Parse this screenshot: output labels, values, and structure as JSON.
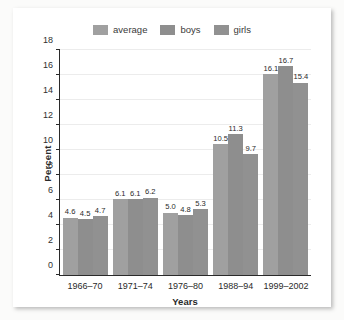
{
  "chart_data": {
    "type": "bar",
    "title": "",
    "xlabel": "Years",
    "ylabel": "Percent",
    "categories": [
      "1966–70",
      "1971–74",
      "1976–80",
      "1988–94",
      "1999–2002"
    ],
    "series": [
      {
        "name": "average",
        "color": "#a0a0a0",
        "values": [
          4.6,
          6.1,
          5.0,
          10.5,
          16.1
        ]
      },
      {
        "name": "boys",
        "color": "#8e8e8e",
        "values": [
          4.5,
          6.1,
          4.8,
          11.3,
          16.7
        ]
      },
      {
        "name": "girls",
        "color": "#919191",
        "values": [
          4.7,
          6.2,
          5.3,
          9.7,
          15.4
        ]
      }
    ],
    "value_labels": [
      [
        "4.6",
        "4.5",
        "4.7"
      ],
      [
        "6.1",
        "6.1",
        "6.2"
      ],
      [
        "5.0",
        "4.8",
        "5.3"
      ],
      [
        "10.5",
        "11.3",
        "9.7"
      ],
      [
        "16.1",
        "16.7",
        "15.4"
      ]
    ],
    "ylim": [
      0,
      18
    ],
    "yticks": [
      0,
      2,
      4,
      6,
      8,
      10,
      12,
      14,
      16,
      18
    ],
    "ytick_labels": [
      "0",
      "2",
      "4",
      "6",
      "8",
      "10",
      "12",
      "14",
      "16",
      "18"
    ],
    "grid": true,
    "legend_position": "top"
  },
  "legend": {
    "items": [
      {
        "label": "average",
        "color": "#a0a0a0"
      },
      {
        "label": "boys",
        "color": "#8e8e8e"
      },
      {
        "label": "girls",
        "color": "#919191"
      }
    ]
  },
  "colors": {
    "page_background": "#fbfbfa",
    "card_background": "#ffffff",
    "axis": "#2a2a2a",
    "gridline": "#ececec",
    "text": "#2a2a2a"
  }
}
